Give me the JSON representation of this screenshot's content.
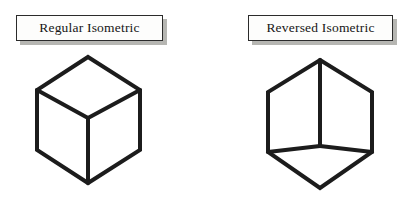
{
  "figure": {
    "width": 420,
    "height": 204,
    "background_color": "#ffffff",
    "stroke_color": "#1c1c1c",
    "stroke_width": 4,
    "shadow_color": "#a9a9a4"
  },
  "panels": [
    {
      "id": "regular",
      "label": "Regular Isometric",
      "label_box": {
        "x": 16,
        "y": 15,
        "width": 147,
        "height": 26
      },
      "cube": {
        "kind": "regular-isometric",
        "description": "Hexagonal cube outline with interior Y-junction meeting at the upper-middle point; branches go up-left, up-right and straight down, so the top face is visible.",
        "outline": [
          [
            88,
            57
          ],
          [
            140,
            90
          ],
          [
            140,
            150
          ],
          [
            88,
            183
          ],
          [
            37,
            150
          ],
          [
            37,
            90
          ]
        ],
        "center": [
          88,
          118
        ],
        "interior_edges": [
          [
            [
              88,
              118
            ],
            [
              37,
              90
            ]
          ],
          [
            [
              88,
              118
            ],
            [
              140,
              90
            ]
          ],
          [
            [
              88,
              118
            ],
            [
              88,
              183
            ]
          ]
        ]
      }
    },
    {
      "id": "reversed",
      "label": "Reversed Isometric",
      "label_box": {
        "x": 248,
        "y": 15,
        "width": 145,
        "height": 26
      },
      "cube": {
        "kind": "reversed-isometric",
        "description": "Hexagonal cube outline with interior Y-junction meeting at the lower-middle point; branches go straight up, down-left and down-right, so the bottom face is visible.",
        "outline": [
          [
            320,
            60
          ],
          [
            372,
            92
          ],
          [
            372,
            152
          ],
          [
            320,
            188
          ],
          [
            268,
            152
          ],
          [
            268,
            92
          ]
        ],
        "center": [
          320,
          146
        ],
        "interior_edges": [
          [
            [
              320,
              146
            ],
            [
              320,
              60
            ]
          ],
          [
            [
              320,
              146
            ],
            [
              268,
              152
            ]
          ],
          [
            [
              320,
              146
            ],
            [
              372,
              152
            ]
          ]
        ]
      }
    }
  ]
}
